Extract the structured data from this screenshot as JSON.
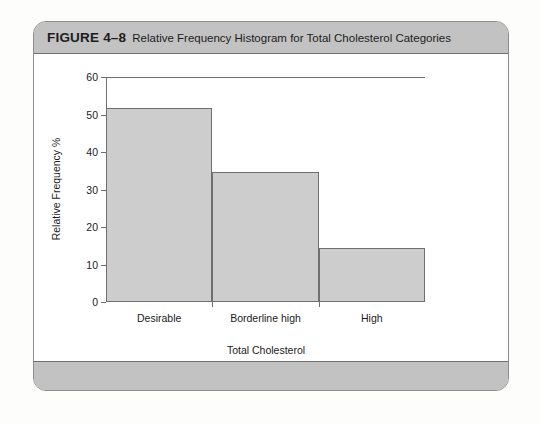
{
  "figure": {
    "number": "FIGURE 4–8",
    "caption": "Relative Frequency Histogram for Total Cholesterol Categories"
  },
  "colors": {
    "header_band": "#c2c2c2",
    "bar_fill": "#cdcdcd",
    "bar_stroke": "#6f6f6f",
    "page_background": "#fdfdfb",
    "card_background": "#ffffff"
  },
  "chart_data": {
    "type": "bar",
    "title": "Relative Frequency Histogram for Total Cholesterol Categories",
    "categories": [
      "Desirable",
      "Borderline high",
      "High"
    ],
    "values": [
      51.5,
      34.3,
      14.2
    ],
    "xlabel": "Total Cholesterol",
    "ylabel": "Relative Frequency %",
    "ylim": [
      0,
      60
    ],
    "yticks": [
      0,
      10,
      20,
      30,
      40,
      50,
      60
    ],
    "ytick_labels": [
      "0",
      "10",
      "20",
      "30",
      "40",
      "50",
      "60"
    ],
    "grid": false,
    "legend": false,
    "bar_gap": 0
  }
}
